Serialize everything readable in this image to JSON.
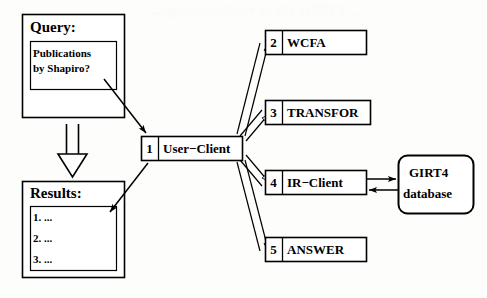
{
  "diagram": {
    "background_color": "#fdfdfc",
    "stroke_color": "#000000",
    "fill_color": "#ffffff",
    "ghost_text": "...ographic.Store to the GIRT4 ...",
    "query_panel": {
      "title": "Query:",
      "lines": [
        "Publications",
        "by Shapiro?"
      ]
    },
    "results_panel": {
      "title": "Results:",
      "lines": [
        "1. ...",
        "2. ...",
        "3. ..."
      ]
    },
    "nodes": [
      {
        "number": "1",
        "name": "User−Client"
      },
      {
        "number": "2",
        "name": "WCFA"
      },
      {
        "number": "3",
        "name": "TRANSFOR"
      },
      {
        "number": "4",
        "name": "IR−Client"
      },
      {
        "number": "5",
        "name": "ANSWER"
      }
    ],
    "database": {
      "line1": "GIRT4",
      "line2": "database",
      "shape": "rounded-rectangle"
    },
    "connectors": [
      {
        "from": "query-panel",
        "to": "node-1",
        "style": "thin-solid-arrow"
      },
      {
        "from": "node-1",
        "to": "results-panel",
        "style": "thin-solid-arrow"
      },
      {
        "from": "query-panel",
        "to": "results-panel",
        "style": "thick-hollow-down-arrow"
      },
      {
        "from": "node-1",
        "to": "node-2",
        "style": "double-line-open-arrow"
      },
      {
        "from": "node-1",
        "to": "node-3",
        "style": "double-line-open-arrow"
      },
      {
        "from": "node-1",
        "to": "node-4",
        "style": "double-line-open-arrow"
      },
      {
        "from": "node-1",
        "to": "node-5",
        "style": "double-line-open-arrow"
      },
      {
        "from": "node-4",
        "to": "database",
        "style": "thin-solid-arrow"
      },
      {
        "from": "database",
        "to": "node-4",
        "style": "thin-solid-arrow"
      }
    ]
  }
}
